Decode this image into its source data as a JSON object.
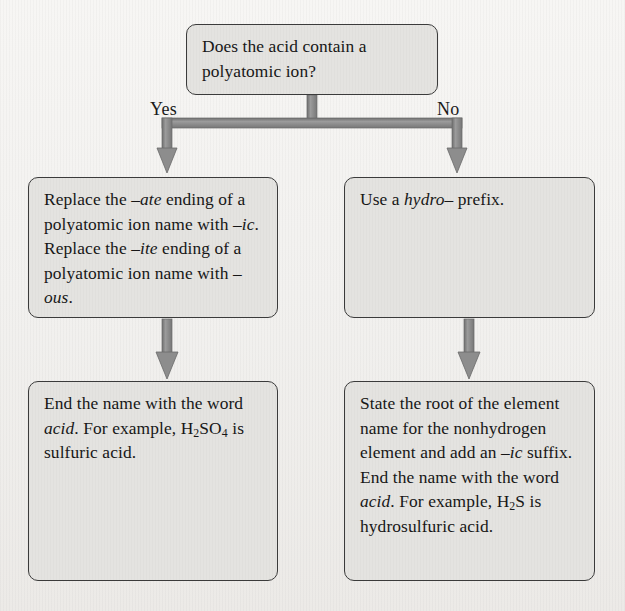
{
  "diagram": {
    "background_color": "#f5f4f2",
    "node_fill_color": "#e4e3e0",
    "node_border_color": "#3b3b3b",
    "connector_color": "#8a8a8a",
    "text_color": "#171717"
  },
  "nodes": {
    "question": {
      "text": "Does the acid contain a polyatomic ion?",
      "line1": "Does the acid contain a",
      "line2": "polyatomic ion?"
    },
    "polyatomic": {
      "text": "Replace the –ate ending of a polyatomic ion name with –ic. Replace the –ite ending of a polyatomic ion name with –ous.",
      "seg1": "Replace the ",
      "seg2": "–ate",
      "seg3": " ending of a polyatomic ion name with ",
      "seg4": "–ic",
      "seg5": ". Replace the ",
      "seg6": "–ite",
      "seg7": " ending of a polyatomic ion name with ",
      "seg8": "–ous",
      "seg9": "."
    },
    "hydro": {
      "text": "Use a hydro– prefix.",
      "seg1": "Use a ",
      "seg2": "hydro–",
      "seg3": " prefix."
    },
    "acid_suffix": {
      "text": "End the name with the word acid. For example, H2SO4 is sulfuric acid.",
      "seg1": "End the name with the word ",
      "seg2": "acid",
      "seg3": ". For example, H",
      "sub1": "2",
      "seg4": "SO",
      "sub2": "4",
      "seg5": " is sulfuric acid."
    },
    "hydro_acid": {
      "text": "State the root of the element name for the nonhydrogen element and add an –ic suffix. End the name with the word acid. For example, H2S is hydrosulfuric acid.",
      "seg1": "State the root of the element name for the nonhydrogen element and add an ",
      "seg2": "–ic",
      "seg3": " suffix. End the name with the word ",
      "seg4": "acid",
      "seg5": ". For example, H",
      "sub1": "2",
      "seg6": "S is hydrosulfuric acid."
    }
  },
  "branches": {
    "yes_label": "Yes",
    "no_label": "No"
  },
  "connectors": {
    "split_from_question": "arrow-split-down",
    "left_vertical": "arrow-down",
    "right_vertical": "arrow-down"
  }
}
